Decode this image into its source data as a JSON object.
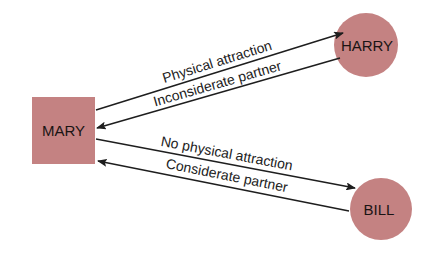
{
  "colors": {
    "node_fill": "#c48282",
    "line": "#1e1e1e",
    "background": "#ffffff"
  },
  "nodes": {
    "mary": {
      "label": "MARY",
      "shape": "square"
    },
    "harry": {
      "label": "HARRY",
      "shape": "circle"
    },
    "bill": {
      "label": "BILL",
      "shape": "circle"
    }
  },
  "edges": [
    {
      "from": "MARY",
      "to": "HARRY",
      "label": "Physical attraction"
    },
    {
      "from": "HARRY",
      "to": "MARY",
      "label": "Inconsiderate partner"
    },
    {
      "from": "MARY",
      "to": "BILL",
      "label": "No physical attraction"
    },
    {
      "from": "BILL",
      "to": "MARY",
      "label": "Considerate partner"
    }
  ]
}
